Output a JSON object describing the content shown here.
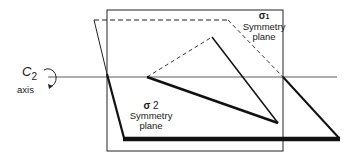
{
  "diagram": {
    "axis_label": {
      "symbol": "C",
      "subscript": "2",
      "word": "axis"
    },
    "plane1": {
      "symbol": "σ",
      "subscript": "1",
      "line1": "Symmetry",
      "line2": "plane"
    },
    "plane2": {
      "symbol": "σ",
      "subscript": "2",
      "line1": "Symmetry",
      "line2": "plane"
    },
    "colors": {
      "line": "#111111",
      "background": "#ffffff"
    }
  }
}
